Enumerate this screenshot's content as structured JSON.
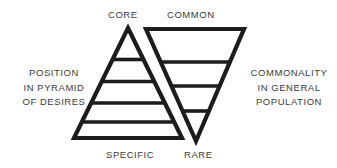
{
  "diagram": {
    "title_top_left": "CORE",
    "title_top_right": "COMMON",
    "title_bottom_left": "SPECIFIC",
    "title_bottom_right": "RARE",
    "axis_left": {
      "line1": "POSITION",
      "line2": "IN PYRAMID",
      "line3": "OF DESIRES"
    },
    "axis_right": {
      "line1": "COMMONALITY",
      "line2": "IN GENERAL",
      "line3": "POPULATION"
    },
    "colors": {
      "stroke": "#1c1c1c",
      "text": "#3b3b3b",
      "background": "#ffffff"
    },
    "shapes": {
      "pyramid": {
        "name": "upward-pyramid",
        "apex": [
          128,
          28
        ],
        "base_left": [
          74,
          138
        ],
        "base_right": [
          182,
          138
        ],
        "divider_count": 4
      },
      "inverted_pyramid": {
        "name": "inverted-pyramid",
        "top_left": [
          146,
          29
        ],
        "top_right": [
          244,
          29
        ],
        "apex": [
          196,
          141
        ],
        "divider_count": 3
      }
    }
  }
}
